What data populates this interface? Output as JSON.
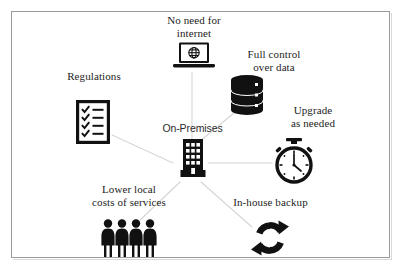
{
  "figure": {
    "type": "hub-and-spoke diagram",
    "background_color": "#ffffff",
    "frame_color": "#9a9a9a",
    "ink_color": "#111111",
    "spoke_color": "#d6d6d6"
  },
  "center": {
    "label": "On-Premises",
    "icon": "office-building-icon"
  },
  "nodes": [
    {
      "id": "no-need-for-internet",
      "label": "No need for\ninternet",
      "icon": "laptop-globe-icon",
      "position": "top"
    },
    {
      "id": "full-control-over-data",
      "label": "Full  control\nover  data",
      "icon": "database-stack-icon",
      "position": "top-right"
    },
    {
      "id": "upgrade-as-needed",
      "label": "Upgrade\nas needed",
      "icon": "stopwatch-icon",
      "position": "right"
    },
    {
      "id": "in-house-backup",
      "label": "In-house backup",
      "icon": "sync-arrows-icon",
      "position": "bottom-right"
    },
    {
      "id": "lower-local-costs-of-services",
      "label": "Lower local\ncosts of services",
      "icon": "people-group-icon",
      "position": "bottom-left"
    },
    {
      "id": "regulations",
      "label": "Regulations",
      "icon": "checklist-clipboard-icon",
      "position": "left"
    }
  ]
}
